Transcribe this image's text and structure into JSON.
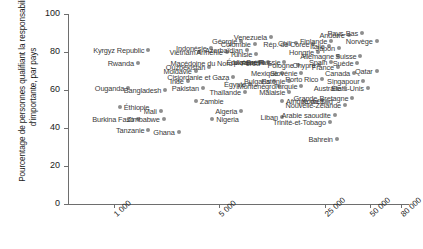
{
  "chart_data": {
    "type": "scatter",
    "title": "",
    "xlabel": "",
    "ylabel": "Pourcentage de personnes qualifiant la responsabilité d'importante, par pays",
    "xscale": "log",
    "xlim": [
      500,
      90000
    ],
    "ylim": [
      0,
      100
    ],
    "grid": false,
    "legend": null,
    "xticks": [
      {
        "value": 1000,
        "label": "1 000"
      },
      {
        "value": 5000,
        "label": "5 000"
      },
      {
        "value": 25000,
        "label": "25 000"
      },
      {
        "value": 50000,
        "label": "50 000"
      },
      {
        "value": 80000,
        "label": "80 000"
      }
    ],
    "yticks": [
      {
        "value": 0,
        "label": "0"
      },
      {
        "value": 20,
        "label": "20"
      },
      {
        "value": 40,
        "label": "40"
      },
      {
        "value": 60,
        "label": "60"
      },
      {
        "value": 80,
        "label": "80"
      },
      {
        "value": 100,
        "label": "100"
      }
    ],
    "marker_color": "#8e8e8e",
    "label_color": "#3a3a3a",
    "axis_color": "#6e6e6e",
    "points": [
      {
        "name": "Kyrgyz Republic",
        "x": 1700,
        "y": 81,
        "side": "r"
      },
      {
        "name": "Rwanda",
        "x": 1450,
        "y": 74,
        "side": "r"
      },
      {
        "name": "Ouganda",
        "x": 1250,
        "y": 61,
        "side": "r"
      },
      {
        "name": "Bangladesh",
        "x": 2200,
        "y": 60,
        "side": "r"
      },
      {
        "name": "Éthiopie",
        "x": 1100,
        "y": 51,
        "side": "l"
      },
      {
        "name": "Burkina Faso",
        "x": 1450,
        "y": 45,
        "side": "r"
      },
      {
        "name": "Tanzanie",
        "x": 1700,
        "y": 39,
        "side": "r"
      },
      {
        "name": "Mali",
        "x": 2050,
        "y": 49,
        "side": "r"
      },
      {
        "name": "Zimbabwe",
        "x": 2150,
        "y": 45,
        "side": "r"
      },
      {
        "name": "Ghana",
        "x": 2700,
        "y": 38,
        "side": "r"
      },
      {
        "name": "Inde",
        "x": 3100,
        "y": 65,
        "side": "r"
      },
      {
        "name": "Moldavie",
        "x": 3500,
        "y": 70,
        "side": "r"
      },
      {
        "name": "Pakistan",
        "x": 3900,
        "y": 61,
        "side": "r"
      },
      {
        "name": "Vietnam",
        "x": 3700,
        "y": 80,
        "side": "r"
      },
      {
        "name": "Indonésie",
        "x": 4400,
        "y": 82,
        "side": "r"
      },
      {
        "name": "Ouzbékistan",
        "x": 4300,
        "y": 72,
        "side": "r"
      },
      {
        "name": "Zambie",
        "x": 3500,
        "y": 54,
        "side": "l"
      },
      {
        "name": "Nigeria",
        "x": 4500,
        "y": 45,
        "side": "l"
      },
      {
        "name": "Arménie",
        "x": 5600,
        "y": 80,
        "side": "r"
      },
      {
        "name": "Macédoine du Nord",
        "x": 6500,
        "y": 74,
        "side": "r"
      },
      {
        "name": "Cisjordanie et Gaza",
        "x": 6200,
        "y": 67,
        "side": "r"
      },
      {
        "name": "Égypte",
        "x": 8000,
        "y": 63,
        "side": "r"
      },
      {
        "name": "Thaïlande",
        "x": 7400,
        "y": 59,
        "side": "r"
      },
      {
        "name": "Algeria",
        "x": 7000,
        "y": 49,
        "side": "r"
      },
      {
        "name": "Azerbaïdjan",
        "x": 7600,
        "y": 81,
        "side": "r"
      },
      {
        "name": "Géorgie",
        "x": 7000,
        "y": 86,
        "side": "r"
      },
      {
        "name": "Tunisie",
        "x": 8800,
        "y": 79,
        "side": "r"
      },
      {
        "name": "Équateur",
        "x": 9200,
        "y": 75,
        "side": "r"
      },
      {
        "name": "Ukraine",
        "x": 9500,
        "y": 75,
        "side": "r"
      },
      {
        "name": "Pérou",
        "x": 9900,
        "y": 74,
        "side": "r"
      },
      {
        "name": "Brésil",
        "x": 10500,
        "y": 75,
        "side": "r"
      },
      {
        "name": "Colombie",
        "x": 8600,
        "y": 84,
        "side": "r"
      },
      {
        "name": "Venezuela",
        "x": 11000,
        "y": 88,
        "side": "r"
      },
      {
        "name": "Chili",
        "x": 16000,
        "y": 85,
        "side": "r"
      },
      {
        "name": "Russie",
        "x": 13500,
        "y": 75,
        "side": "r"
      },
      {
        "name": "Pologne",
        "x": 16500,
        "y": 73,
        "side": "r"
      },
      {
        "name": "Mexique",
        "x": 13000,
        "y": 69,
        "side": "r"
      },
      {
        "name": "Slovénie",
        "x": 17500,
        "y": 69,
        "side": "r"
      },
      {
        "name": "Bulgaria",
        "x": 11500,
        "y": 65,
        "side": "r"
      },
      {
        "name": "Estonie",
        "x": 14500,
        "y": 65,
        "side": "r"
      },
      {
        "name": "Monténégro",
        "x": 12500,
        "y": 62,
        "side": "r"
      },
      {
        "name": "Turquie",
        "x": 17500,
        "y": 62,
        "side": "r"
      },
      {
        "name": "Malaisie",
        "x": 14500,
        "y": 59,
        "side": "r"
      },
      {
        "name": "Afrique du Sud",
        "x": 13000,
        "y": 54,
        "side": "l"
      },
      {
        "name": "Liban",
        "x": 13000,
        "y": 46,
        "side": "r"
      },
      {
        "name": "Rép. de Corée",
        "x": 21000,
        "y": 84,
        "side": "r"
      },
      {
        "name": "Hongrie",
        "x": 22500,
        "y": 80,
        "side": "r"
      },
      {
        "name": "Chypre",
        "x": 23000,
        "y": 73,
        "side": "r"
      },
      {
        "name": "Italie",
        "x": 26500,
        "y": 83,
        "side": "r"
      },
      {
        "name": "Finlande",
        "x": 27500,
        "y": 86,
        "side": "r"
      },
      {
        "name": "Japon",
        "x": 31000,
        "y": 82,
        "side": "r"
      },
      {
        "name": "Allemagne",
        "x": 30500,
        "y": 78,
        "side": "r"
      },
      {
        "name": "Spain",
        "x": 27500,
        "y": 75,
        "side": "r"
      },
      {
        "name": "France",
        "x": 30500,
        "y": 72,
        "side": "r"
      },
      {
        "name": "Suisse",
        "x": 43000,
        "y": 78,
        "side": "r"
      },
      {
        "name": "Suède",
        "x": 41000,
        "y": 74,
        "side": "r"
      },
      {
        "name": "Canada",
        "x": 39000,
        "y": 69,
        "side": "r"
      },
      {
        "name": "Qatar",
        "x": 55000,
        "y": 70,
        "side": "r"
      },
      {
        "name": "Andorre",
        "x": 36000,
        "y": 89,
        "side": "r"
      },
      {
        "name": "Pays-Bas",
        "x": 44000,
        "y": 90,
        "side": "r"
      },
      {
        "name": "Norvège",
        "x": 55000,
        "y": 86,
        "side": "r"
      },
      {
        "name": "Singapour",
        "x": 45000,
        "y": 65,
        "side": "r"
      },
      {
        "name": "États-Unis",
        "x": 48000,
        "y": 61,
        "side": "r"
      },
      {
        "name": "Porto Rico",
        "x": 24000,
        "y": 66,
        "side": "r"
      },
      {
        "name": "Australie",
        "x": 34000,
        "y": 61,
        "side": "r"
      },
      {
        "name": "Grande-Bretagne",
        "x": 38000,
        "y": 56,
        "side": "r"
      },
      {
        "name": "Nouvelle-Zélande",
        "x": 34000,
        "y": 52,
        "side": "r"
      },
      {
        "name": "Koweït",
        "x": 26000,
        "y": 54,
        "side": "r"
      },
      {
        "name": "Arabie saoudite",
        "x": 29000,
        "y": 47,
        "side": "r"
      },
      {
        "name": "Trinité-et-Tobago",
        "x": 27000,
        "y": 43,
        "side": "r"
      },
      {
        "name": "Bahrein",
        "x": 30000,
        "y": 34,
        "side": "r"
      }
    ]
  }
}
